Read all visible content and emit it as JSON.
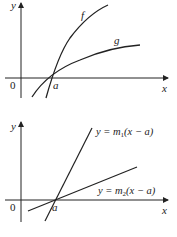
{
  "top_graph": {
    "y_axis_label": "y",
    "x_axis_label": "x",
    "origin_label": "0",
    "point_label": "a",
    "curve_f_label": "f",
    "curve_g_label": "g"
  },
  "bottom_graph": {
    "y_axis_label": "y",
    "x_axis_label": "x",
    "origin_label": "0",
    "point_label": "a",
    "line1": {
      "prefix": "y = m",
      "sub": "1",
      "suffix": "(x − a)"
    },
    "line2": {
      "prefix": "y = m",
      "sub": "2",
      "suffix": "(x − a)"
    }
  }
}
